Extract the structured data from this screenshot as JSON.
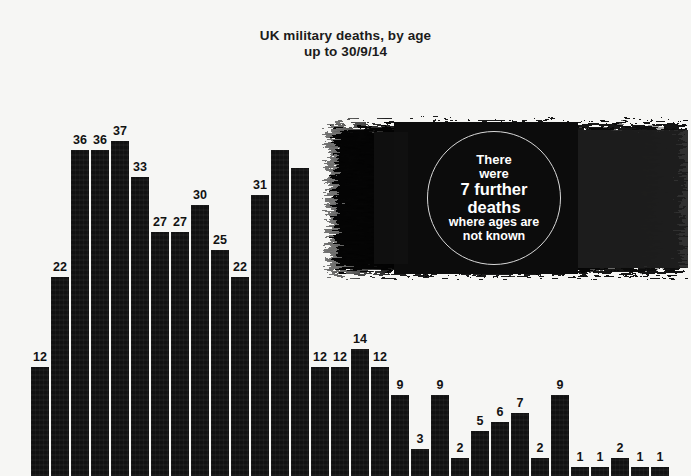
{
  "title": {
    "line1": "UK military deaths, by age",
    "line2": "up to 30/9/14"
  },
  "callout": {
    "line1": "There",
    "line2": "were",
    "line3": "7 further",
    "line4": "deaths",
    "line5": "where ages are",
    "line6": "not known"
  },
  "colors": {
    "background": "#f6f6f4",
    "bar": "#111111",
    "text": "#121212",
    "callout_text": "#ffffff",
    "callout_ring": "#d8d8d8"
  },
  "chart_data": {
    "type": "bar",
    "title": "UK military deaths, by age up to 30/9/14",
    "xlabel": "",
    "ylabel": "",
    "grid": false,
    "legend": false,
    "ylim": [
      0,
      37
    ],
    "note": "7 further deaths where ages are not known",
    "categories": [
      "b1",
      "b2",
      "b3",
      "b4",
      "b5",
      "b6",
      "b7",
      "b8",
      "b9",
      "b10",
      "b11",
      "b12",
      "b13",
      "b14",
      "b15",
      "b16",
      "b17",
      "b18",
      "b19",
      "b20",
      "b21",
      "b22",
      "b23",
      "b24",
      "b25",
      "b26",
      "b27",
      "b28",
      "b29",
      "b30",
      "b31",
      "b32",
      "b33"
    ],
    "values": [
      12,
      22,
      36,
      36,
      37,
      33,
      27,
      27,
      30,
      25,
      22,
      31,
      36,
      34,
      12,
      12,
      14,
      12,
      9,
      3,
      9,
      2,
      5,
      6,
      7,
      2,
      9,
      1,
      1,
      2,
      1,
      1,
      0
    ],
    "labels": [
      "12",
      "22",
      "36",
      "36",
      "37",
      "33",
      "27",
      "27",
      "30",
      "25",
      "22",
      "31",
      "",
      "",
      "12",
      "12",
      "14",
      "12",
      "9",
      "3",
      "9",
      "2",
      "5",
      "6",
      "7",
      "2",
      "9",
      "1",
      "1",
      "2",
      "1",
      "1",
      ""
    ]
  }
}
